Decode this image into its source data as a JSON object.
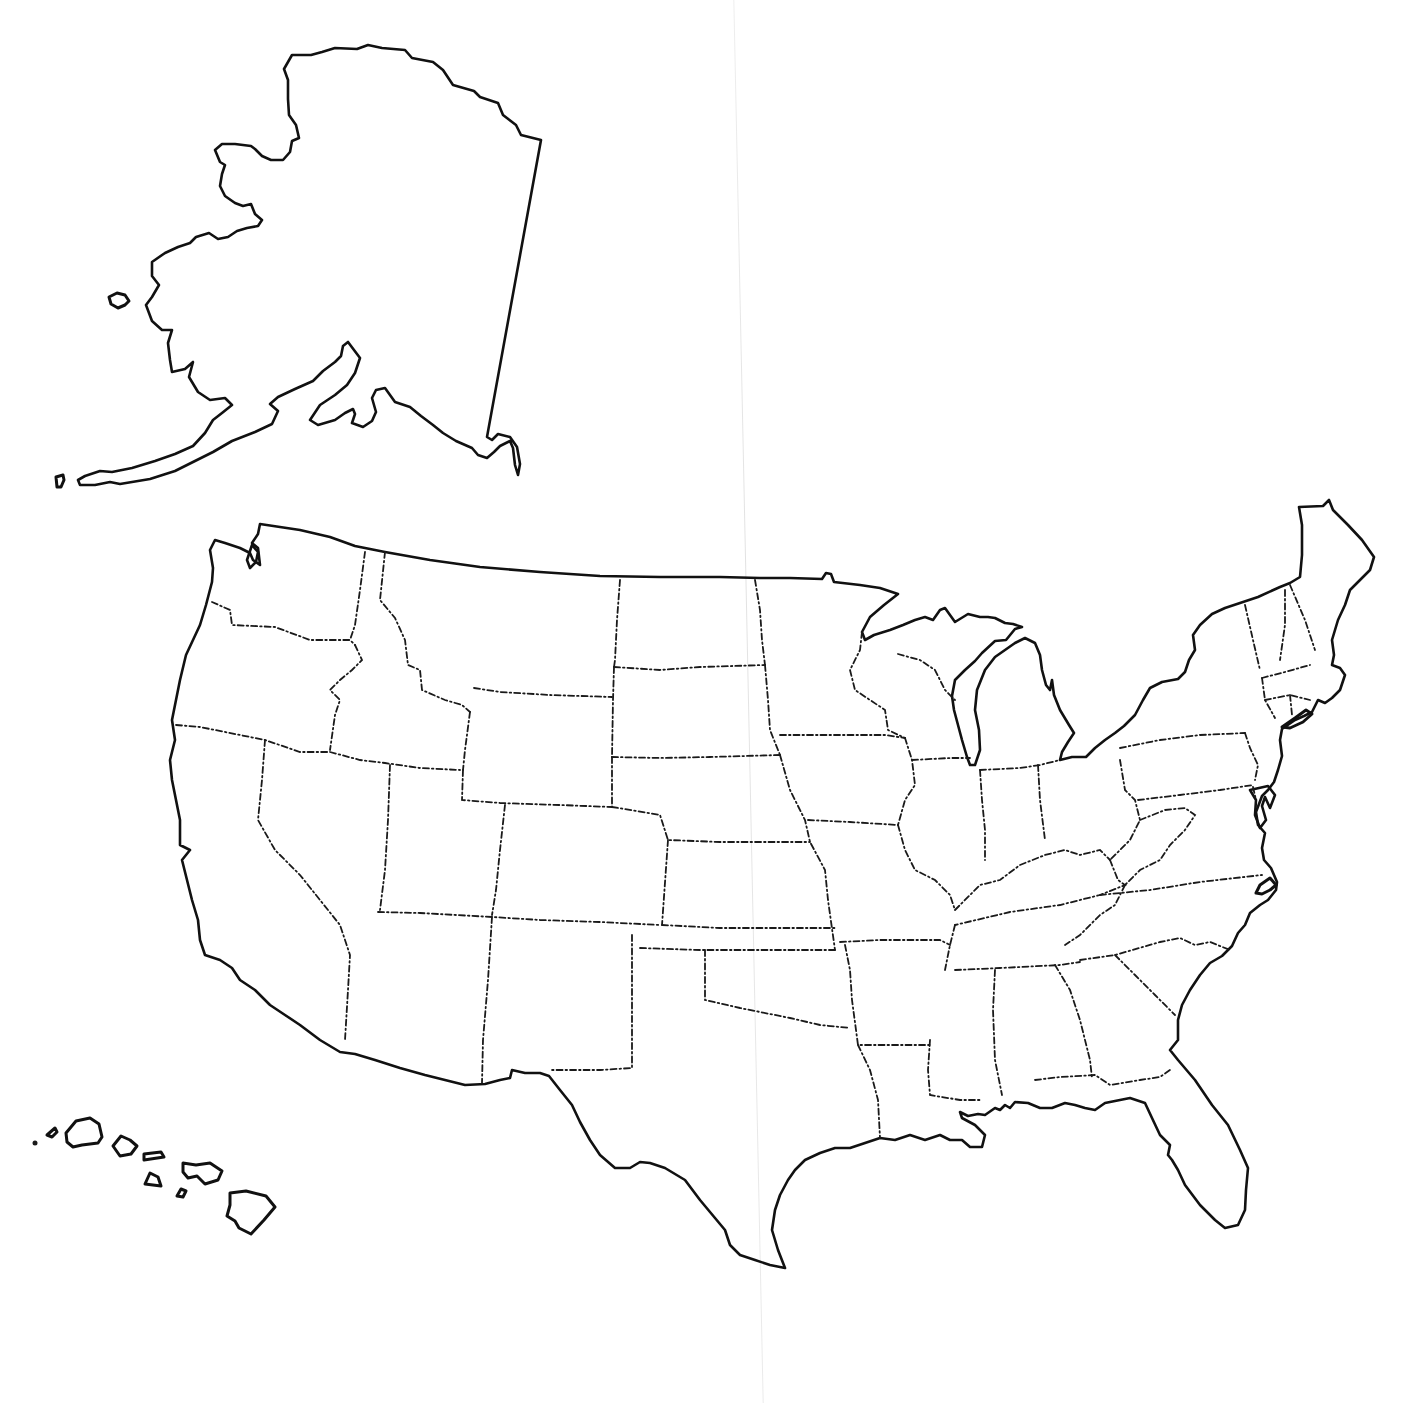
{
  "map": {
    "type": "blank outline map",
    "subject": "United States",
    "regions": [
      "alaska",
      "hawaii",
      "contiguous-us"
    ],
    "labels": [],
    "colors": {
      "background": "#ffffff",
      "outline": "#111111",
      "state_borders": "#1a1a1a"
    },
    "line_styles": {
      "national_and_coastal_borders": "solid",
      "state_borders": "dash-dot"
    }
  }
}
